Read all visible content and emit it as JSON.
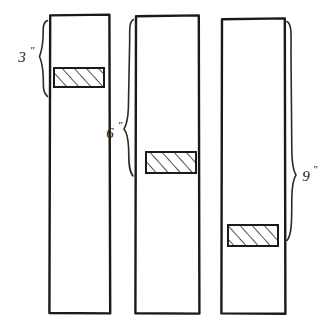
{
  "figure": {
    "background_color": "#ffffff",
    "ink_color": "#1a1a1a",
    "boards": [
      {
        "name": "board-left",
        "x": 49,
        "y": 14,
        "width": 61,
        "height": 300,
        "hatch": {
          "x": 54,
          "y": 68,
          "width": 50,
          "height": 19
        }
      },
      {
        "name": "board-middle",
        "x": 135,
        "y": 15,
        "width": 64,
        "height": 299,
        "hatch": {
          "x": 146,
          "y": 152,
          "width": 50,
          "height": 21
        }
      },
      {
        "name": "board-right",
        "x": 221,
        "y": 18,
        "width": 64,
        "height": 296,
        "hatch": {
          "x": 228,
          "y": 225,
          "width": 50,
          "height": 21
        }
      }
    ],
    "dimensions": [
      {
        "name": "dimension-3-inch",
        "value": "3",
        "unit": "″",
        "label_x": 22,
        "label_y": 57,
        "brace_top": 20,
        "brace_bottom": 97,
        "brace_x": 44
      },
      {
        "name": "dimension-6-inch",
        "value": "6",
        "unit": "″",
        "label_x": 108,
        "label_y": 133,
        "brace_top": 20,
        "brace_bottom": 178,
        "brace_x": 130
      },
      {
        "name": "dimension-9-inch",
        "value": "9",
        "unit": "″",
        "label_x": 298,
        "label_y": 178,
        "brace_top": 22,
        "brace_bottom": 242,
        "brace_x": 291
      }
    ]
  }
}
